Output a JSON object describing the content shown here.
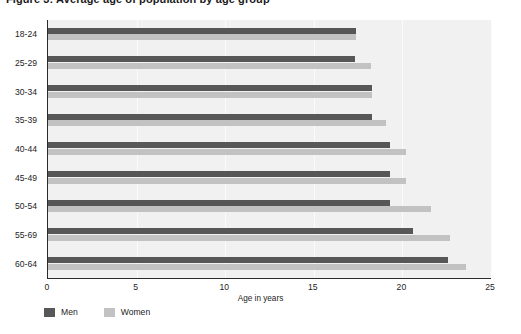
{
  "header": {
    "clipped_title": "Figure 3: Average age of population by age group"
  },
  "chart_data": {
    "type": "bar",
    "orientation": "horizontal",
    "title": "",
    "xlabel": "Age in years",
    "ylabel": "",
    "categories": [
      "18-24",
      "25-29",
      "30-34",
      "35-39",
      "40-44",
      "45-49",
      "50-54",
      "55-69",
      "60-64"
    ],
    "series": [
      {
        "name": "Men",
        "color": "#575757",
        "values": [
          17.4,
          17.3,
          18.3,
          18.3,
          19.3,
          19.3,
          19.3,
          20.6,
          22.6
        ]
      },
      {
        "name": "Women",
        "color": "#c2c2c2",
        "values": [
          17.4,
          18.2,
          18.3,
          19.1,
          20.2,
          20.2,
          21.6,
          22.7,
          23.6
        ]
      }
    ],
    "xlim": [
      0,
      25
    ],
    "xticks": [
      0,
      5,
      10,
      15,
      20,
      25
    ],
    "xtick_labels": [
      "0",
      "5",
      "10",
      "15",
      "20",
      "25"
    ],
    "grid": true,
    "grid_axis": "x",
    "legend_position": "bottom-left",
    "plot_background": "#f1f1f1",
    "axis_color": "#2b2b2b"
  }
}
